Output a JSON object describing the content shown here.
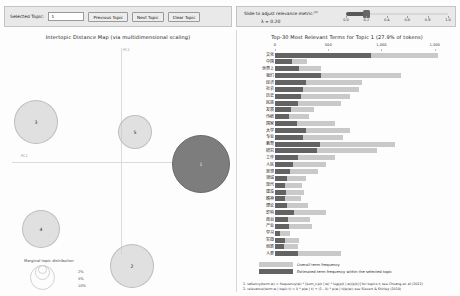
{
  "topic_control": {
    "label": "Selected Topic:",
    "value": "1",
    "previous_label": "Previous Topic",
    "next_label": "Next Topic",
    "clear_label": "Clear Topic"
  },
  "lambda_control": {
    "caption": "Slide to adjust relevance metric:",
    "caption_sup": "(2)",
    "value_label": "λ = 0.20",
    "lambda": 0.2,
    "ticks": [
      "0.0",
      "0.2",
      "0.4",
      "0.6",
      "0.8",
      "1.0"
    ]
  },
  "left_panel": {
    "title": "Intertopic Distance Map (via multidimensional scaling)",
    "x_axis_label": "PC1",
    "y_axis_label": "PC2",
    "marginal_legend": {
      "title": "Marginal topic distribution",
      "percents": [
        "2%",
        "5%",
        "10%"
      ]
    },
    "topics": [
      {
        "id": "1",
        "x": 197,
        "y": 120,
        "r": 29,
        "selected": true
      },
      {
        "id": "2",
        "x": 128,
        "y": 222,
        "r": 22,
        "selected": false
      },
      {
        "id": "3",
        "x": 32,
        "y": 78,
        "r": 22,
        "selected": false
      },
      {
        "id": "4",
        "x": 37,
        "y": 185,
        "r": 19,
        "selected": false
      },
      {
        "id": "5",
        "x": 131,
        "y": 88,
        "r": 17,
        "selected": false
      }
    ]
  },
  "right_panel": {
    "title": "Top-30 Most Relevant Terms for Topic 1 (27.9% of tokens)",
    "legend": {
      "overall": "Overall term frequency",
      "topic": "Estimated term frequency within the selected topic"
    },
    "footnotes": [
      "1. saliency(term w) = frequency(w) * [sum_t p(t | w) * log(p(t | w)/p(t))] for topics t; see Chuang et. al (2012)",
      "2. relevance(term w | topic t) = λ * p(w | t) + (1 - λ) * p(w | t)/p(w); see Sievert & Shirley (2014)"
    ]
  },
  "chart_data": {
    "type": "bar",
    "title": "Top-30 Most Relevant Terms for Topic 1 (27.9% of tokens)",
    "xlabel": "",
    "ylabel": "",
    "xlim": [
      0,
      1700
    ],
    "xticks": [
      0,
      500,
      1000,
      1500
    ],
    "xtick_labels": [
      "0",
      "500",
      "1,000",
      "1,500"
    ],
    "orientation": "horizontal",
    "grid": false,
    "legend_position": "bottom",
    "categories": [
      "文化",
      "中国",
      "世界上",
      "我们",
      "经济",
      "社会",
      "历史",
      "民族",
      "发展",
      "传统",
      "国家",
      "大学",
      "专业",
      "教育",
      "研究",
      "工作",
      "人民",
      "思想",
      "领域",
      "现代",
      "建设",
      "精神",
      "理论",
      "影响",
      "政治",
      "产业",
      "学习",
      "实践",
      "创新",
      "人类"
    ],
    "series": [
      {
        "name": "Overall term frequency",
        "values": [
          1530,
          300,
          430,
          1180,
          820,
          790,
          700,
          620,
          365,
          320,
          560,
          700,
          640,
          1125,
          960,
          560,
          480,
          400,
          290,
          250,
          270,
          245,
          310,
          480,
          330,
          350,
          140,
          230,
          215,
          620
        ]
      },
      {
        "name": "Estimated term frequency within the selected topic",
        "values": [
          905,
          155,
          230,
          430,
          290,
          260,
          245,
          215,
          150,
          130,
          205,
          290,
          265,
          420,
          390,
          215,
          165,
          140,
          110,
          95,
          100,
          90,
          115,
          175,
          125,
          130,
          45,
          90,
          80,
          215
        ]
      }
    ]
  },
  "colors": {
    "bar_overall": "#c9c9c9",
    "bar_topic": "#636363",
    "bubble_selected": "#7d7d7d",
    "bubble_normal": "#c8c8c8",
    "panel_bg": "#fdfdfd",
    "toolbar_bg": "#e9e9e9"
  }
}
